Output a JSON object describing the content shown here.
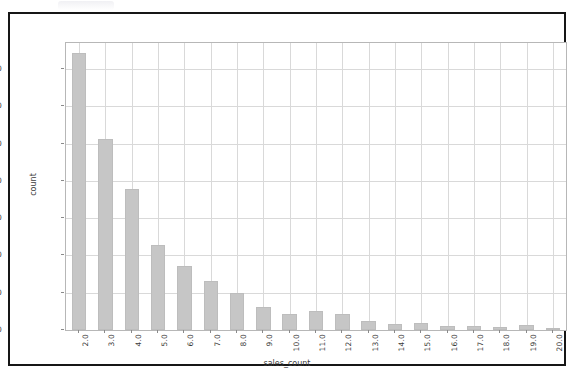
{
  "figure": {
    "background_color": "#ffffff",
    "frame_color": "#161616",
    "axes_edge_color": "#b7b7b7",
    "grid_color": "#d9d9d9",
    "bar_color": "#c6c6c6",
    "tick_label_color": "#3b3b3b"
  },
  "chart_data": {
    "type": "bar",
    "title": "",
    "subtitle": "",
    "xlabel": "sales_count",
    "ylabel": "count",
    "grid": true,
    "legend": false,
    "legend_position": "none",
    "xtick_rotation": -90,
    "categories": [
      "2.0",
      "3.0",
      "4.0",
      "5.0",
      "6.0",
      "7.0",
      "8.0",
      "9.0",
      "10.0",
      "11.0",
      "12.0",
      "13.0",
      "14.0",
      "15.0",
      "16.0",
      "17.0",
      "18.0",
      "19.0",
      "20.0"
    ],
    "values": [
      742,
      512,
      378,
      228,
      172,
      132,
      100,
      62,
      42,
      52,
      42,
      24,
      17,
      20,
      11,
      12,
      8,
      14,
      6
    ],
    "ylim": [
      0,
      770
    ],
    "yticks": [
      0,
      100,
      200,
      300,
      400,
      500,
      600,
      700
    ],
    "ytick_labels": [
      "0",
      "100",
      "200",
      "300",
      "400",
      "500",
      "600",
      "700"
    ]
  }
}
